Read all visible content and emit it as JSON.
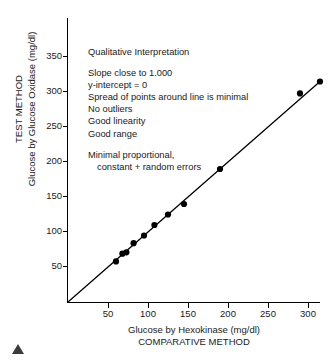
{
  "chart_data": {
    "type": "scatter",
    "title": "",
    "xlabel": "Glucose by Hexokinase (mg/dl)",
    "xlabel2": "COMPARATIVE METHOD",
    "ylabel": "TEST METHOD",
    "ylabel2": "Glucose by Glucose Oxidase (mg/dl)",
    "xlim": [
      0,
      315
    ],
    "ylim": [
      0,
      355
    ],
    "xticks": [
      50,
      100,
      150,
      200,
      250,
      300
    ],
    "yticks": [
      50,
      100,
      150,
      200,
      250,
      300,
      350
    ],
    "grid": false,
    "legend": null,
    "series": [
      {
        "name": "Glucose method comparison",
        "marker": "filled-circle",
        "x": [
          60,
          68,
          73,
          82,
          95,
          108,
          125,
          145,
          190,
          290,
          315
        ],
        "y": [
          58,
          69,
          71,
          84,
          95,
          110,
          125,
          140,
          190,
          298,
          315
        ]
      }
    ],
    "fit_line": {
      "name": "regression line",
      "slope": 1.0,
      "intercept": 0,
      "x_start": 0,
      "y_start": 0,
      "x_end": 315,
      "y_end": 315
    },
    "annotations": [
      "Qualitative Interpretation",
      "",
      "Slope close to 1.000",
      "y-intercept = 0",
      "Spread of points around line is minimal",
      "No outliers",
      "Good linearity",
      "Good range",
      "",
      "Minimal proportional,",
      "constant + random errors"
    ],
    "colors": {
      "marker": "#000000",
      "line": "#000000",
      "axis": "#000000",
      "text": "#1a1a1a",
      "corner_marker": "#3b3b3b"
    }
  },
  "axis_titles": {
    "y_line1": "TEST METHOD",
    "y_line2": "Glucose by Glucose Oxidase (mg/dl)",
    "x_line1": "Glucose by Hexokinase (mg/dl)",
    "x_line2": "COMPARATIVE METHOD"
  },
  "ytick_labels": [
    "350",
    "300",
    "250",
    "200",
    "150",
    "100",
    "50"
  ],
  "xtick_labels": [
    "50",
    "100",
    "150",
    "200",
    "250",
    "300"
  ],
  "annotation_lines": {
    "l0": "Qualitative Interpretation",
    "l1": "Slope close to 1.000",
    "l2": "y-intercept = 0",
    "l3": "Spread of points around line is minimal",
    "l4": "No outliers",
    "l5": "Good linearity",
    "l6": "Good range",
    "l7": "Minimal proportional,",
    "l8": "constant + random errors"
  }
}
